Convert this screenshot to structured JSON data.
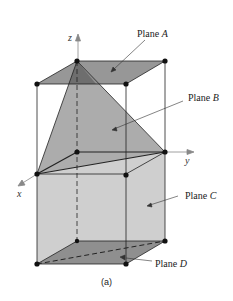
{
  "diagram": {
    "labels": {
      "plane_a": "Plane ",
      "plane_a_var": "A",
      "plane_b": "Plane ",
      "plane_b_var": "B",
      "plane_c": "Plane ",
      "plane_c_var": "C",
      "plane_d": "Plane ",
      "plane_d_var": "D"
    },
    "axes": {
      "x": "x",
      "y": "y",
      "z": "z"
    },
    "caption": "(a)",
    "colors": {
      "plane_a": "#8c8c8c",
      "plane_b": "#a6a6a6",
      "plane_c": "#cfcfcf",
      "plane_d": "#8a8a8a",
      "edge": "#222222"
    }
  }
}
